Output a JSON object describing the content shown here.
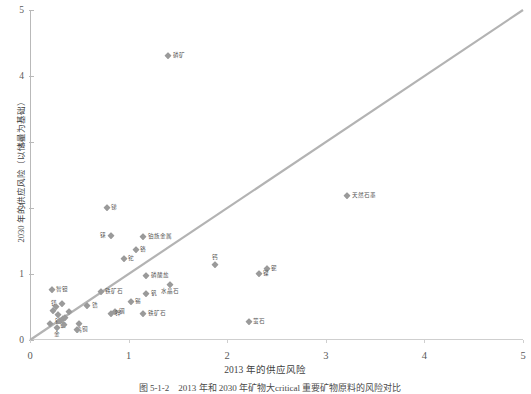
{
  "chart_data": {
    "type": "scatter",
    "title": "",
    "xlabel": "2013 年的供应风险",
    "ylabel": "2030 年的供应风险（以储量为基础）",
    "xlim": [
      0,
      5
    ],
    "ylim": [
      0,
      5
    ],
    "xticks": [
      "0",
      "1",
      "2",
      "3",
      "4",
      "5"
    ],
    "yticks": [
      "0",
      "1",
      "2",
      "3",
      "4",
      "5"
    ],
    "grid": false,
    "legend": "none",
    "reference_line": {
      "name": "y=x",
      "from": [
        0,
        0
      ],
      "to": [
        5,
        5
      ],
      "color": "#b3b3b3"
    },
    "marker": {
      "shape": "diamond",
      "color": "#9a9a9a"
    },
    "points": [
      {
        "label": "磷矿",
        "x": 1.4,
        "y": 4.3,
        "pos": "right"
      },
      {
        "label": "天然石墨",
        "x": 3.22,
        "y": 2.18,
        "pos": "right"
      },
      {
        "label": "锑",
        "x": 0.78,
        "y": 2.0,
        "pos": "right"
      },
      {
        "label": "铼",
        "x": 0.82,
        "y": 1.58,
        "pos": "left"
      },
      {
        "label": "铂族金属",
        "x": 1.15,
        "y": 1.56,
        "pos": "right"
      },
      {
        "label": "铬",
        "x": 1.07,
        "y": 1.36,
        "pos": "right"
      },
      {
        "label": "铊",
        "x": 0.95,
        "y": 1.22,
        "pos": "right"
      },
      {
        "label": "钙",
        "x": 1.88,
        "y": 1.13,
        "pos": "above"
      },
      {
        "label": "铌",
        "x": 2.4,
        "y": 1.08,
        "pos": "right"
      },
      {
        "label": "镍",
        "x": 2.32,
        "y": 1.0,
        "pos": "right"
      },
      {
        "label": "磷酸盐",
        "x": 1.18,
        "y": 0.97,
        "pos": "right"
      },
      {
        "label": "水晶石",
        "x": 1.42,
        "y": 0.83,
        "pos": "below"
      },
      {
        "label": "智钽",
        "x": 0.22,
        "y": 0.76,
        "pos": "right"
      },
      {
        "label": "铁矿石",
        "x": 0.72,
        "y": 0.72,
        "pos": "right"
      },
      {
        "label": "钒",
        "x": 1.18,
        "y": 0.7,
        "pos": "right"
      },
      {
        "label": "锡",
        "x": 1.02,
        "y": 0.58,
        "pos": "right"
      },
      {
        "label": "镁",
        "x": 0.32,
        "y": 0.55,
        "pos": "left"
      },
      {
        "label": "锆",
        "x": 0.58,
        "y": 0.52,
        "pos": "right"
      },
      {
        "label": "铟",
        "x": 0.86,
        "y": 0.42,
        "pos": "right"
      },
      {
        "label": "铁矿石",
        "x": 1.15,
        "y": 0.4,
        "pos": "right"
      },
      {
        "label": "锌",
        "x": 0.82,
        "y": 0.4,
        "pos": "right"
      },
      {
        "label": "铍",
        "x": 0.28,
        "y": 0.38,
        "pos": "below"
      },
      {
        "label": "银",
        "x": 0.33,
        "y": 0.32,
        "pos": "below"
      },
      {
        "label": "钨",
        "x": 0.5,
        "y": 0.25,
        "pos": "below"
      },
      {
        "label": "金",
        "x": 0.27,
        "y": 0.18,
        "pos": "below"
      },
      {
        "label": "铜",
        "x": 0.48,
        "y": 0.15,
        "pos": "right"
      },
      {
        "label": "萤石",
        "x": 2.22,
        "y": 0.28,
        "pos": "right"
      },
      {
        "label": "",
        "x": 0.23,
        "y": 0.44,
        "pos": "right"
      },
      {
        "label": "",
        "x": 0.26,
        "y": 0.5,
        "pos": "right"
      },
      {
        "label": "",
        "x": 0.3,
        "y": 0.29,
        "pos": "right"
      },
      {
        "label": "",
        "x": 0.36,
        "y": 0.34,
        "pos": "right"
      },
      {
        "label": "",
        "x": 0.2,
        "y": 0.24,
        "pos": "right"
      },
      {
        "label": "",
        "x": 0.34,
        "y": 0.22,
        "pos": "right"
      },
      {
        "label": "",
        "x": 0.4,
        "y": 0.42,
        "pos": "right"
      }
    ]
  },
  "caption": "图 5-1-2　2013 年和 2030 年矿物大critical 重要矿物原料的风险对比"
}
